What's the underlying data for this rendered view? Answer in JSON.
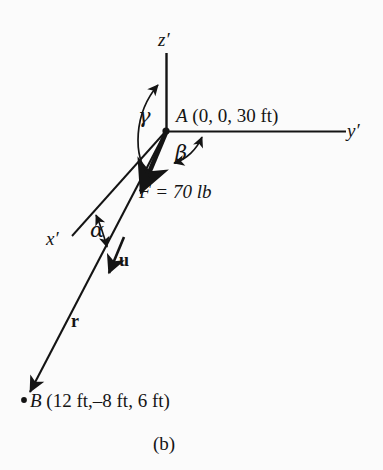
{
  "figure": {
    "caption": "(b)",
    "background_color": "#fbfbfb",
    "ink_color": "#141414",
    "axes": [
      {
        "id": "z",
        "label": "z′",
        "direction": "vertical-up"
      },
      {
        "id": "y",
        "label": "y′",
        "direction": "horizontal-right"
      },
      {
        "id": "x",
        "label": "x′",
        "direction": "oblique-down-left"
      }
    ],
    "angles": [
      {
        "id": "gamma",
        "symbol": "γ",
        "measured_between": "z′ axis and force line"
      },
      {
        "id": "beta",
        "symbol": "β",
        "measured_between": "y′ axis and force line"
      },
      {
        "id": "alpha",
        "symbol": "α",
        "measured_between": "x′ axis and force line"
      }
    ],
    "points": [
      {
        "id": "A",
        "name": "A",
        "coordinates": "(0, 0, 30 ft)",
        "full_label": "A (0, 0, 30 ft)"
      },
      {
        "id": "B",
        "name": "B",
        "coordinates": "(12 ft,–8 ft, 6 ft)",
        "full_label": "B (12 ft,–8 ft, 6 ft)"
      }
    ],
    "vectors": [
      {
        "id": "F",
        "label": "F = 70 lb",
        "magnitude": "70",
        "units": "lb",
        "style": "thick-arrow"
      },
      {
        "id": "u",
        "label": "u",
        "description": "unit vector",
        "style": "bold-arrow"
      },
      {
        "id": "r",
        "label": "r",
        "description": "position vector from A to B",
        "style": "arrow"
      }
    ]
  }
}
